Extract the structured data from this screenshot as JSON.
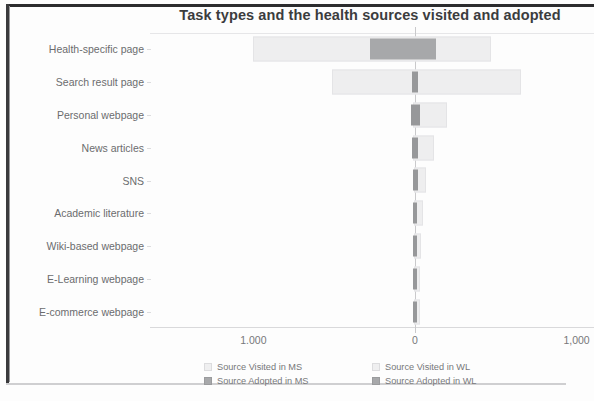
{
  "chart_data": {
    "type": "bar",
    "orientation": "horizontal",
    "layout": "diverging",
    "title": "Task types and the health sources visited and adopted",
    "xlabel": "",
    "ylabel": "",
    "categories": [
      "Health-specific page",
      "Search result page",
      "Personal webpage",
      "News articles",
      "SNS",
      "Academic literature",
      "Wiki-based webpage",
      "E-Learning webpage",
      "E-commerce webpage"
    ],
    "xticks": [
      "1.000",
      "0",
      "1,000"
    ],
    "xtick_values": [
      -1000,
      0,
      1000
    ],
    "xlim": [
      -1640,
      1100
    ],
    "grid": false,
    "legend_position": "bottom",
    "series": [
      {
        "name": "Source Visited in MS",
        "values": [
          1002,
          512,
          12,
          10,
          8,
          8,
          7,
          7,
          6
        ]
      },
      {
        "name": "Source Visited in WL",
        "values": [
          472,
          653,
          200,
          118,
          70,
          52,
          38,
          30,
          28
        ]
      },
      {
        "name": "Source Adopted in MS",
        "values": [
          280,
          20,
          22,
          16,
          14,
          12,
          11,
          10,
          10
        ]
      },
      {
        "name": "Source Adopted in WL",
        "values": [
          132,
          18,
          34,
          20,
          16,
          14,
          13,
          12,
          12
        ]
      }
    ],
    "bars": [
      {
        "category": "Health-specific page",
        "visited_left": 1002,
        "visited_right": 472,
        "adopted_left": 280,
        "adopted_right": 132
      },
      {
        "category": "Search result page",
        "visited_left": 512,
        "visited_right": 653,
        "adopted_left": 20,
        "adopted_right": 18
      },
      {
        "category": "Personal webpage",
        "visited_left": 12,
        "visited_right": 200,
        "adopted_left": 22,
        "adopted_right": 34
      },
      {
        "category": "News articles",
        "visited_left": 10,
        "visited_right": 118,
        "adopted_left": 16,
        "adopted_right": 20
      },
      {
        "category": "SNS",
        "visited_left": 8,
        "visited_right": 70,
        "adopted_left": 14,
        "adopted_right": 16
      },
      {
        "category": "Academic literature",
        "visited_left": 8,
        "visited_right": 52,
        "adopted_left": 12,
        "adopted_right": 14
      },
      {
        "category": "Wiki-based webpage",
        "visited_left": 7,
        "visited_right": 38,
        "adopted_left": 11,
        "adopted_right": 13
      },
      {
        "category": "E-Learning webpage",
        "visited_left": 7,
        "visited_right": 30,
        "adopted_left": 10,
        "adopted_right": 12
      },
      {
        "category": "E-commerce webpage",
        "visited_left": 6,
        "visited_right": 28,
        "adopted_left": 10,
        "adopted_right": 12
      }
    ],
    "colors": {
      "visited": "#EEEEEF",
      "adopted": "#A7A8AA",
      "zero_line": "#C9C9CB",
      "title": "#3B3C3E",
      "tick_text": "#77787A"
    }
  },
  "legend": {
    "items": [
      {
        "label": "Source Visited in MS",
        "swatch": "visited"
      },
      {
        "label": "Source Visited in WL",
        "swatch": "visited"
      },
      {
        "label": "Source Adopted in MS",
        "swatch": "adopted"
      },
      {
        "label": "Source Adopted in WL",
        "swatch": "adopted"
      }
    ]
  }
}
